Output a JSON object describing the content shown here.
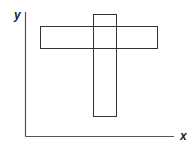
{
  "diagram": {
    "axes": {
      "x_label": "x",
      "y_label": "y"
    },
    "shapes": [
      {
        "name": "horizontal-rectangle",
        "type": "rectangle",
        "orientation": "horizontal"
      },
      {
        "name": "vertical-rectangle",
        "type": "rectangle",
        "orientation": "vertical"
      }
    ],
    "colors": {
      "axis": "#555555",
      "outline": "#333333",
      "background": "#ffffff"
    }
  }
}
